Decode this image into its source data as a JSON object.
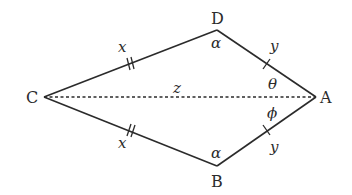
{
  "diagram": {
    "type": "kite-quadrilateral",
    "colors": {
      "stroke": "#2b2b2b",
      "background": "#ffffff"
    },
    "vertices": {
      "A": {
        "label": "A",
        "x": 316,
        "y": 97
      },
      "B": {
        "label": "B",
        "x": 217,
        "y": 166
      },
      "C": {
        "label": "C",
        "x": 44,
        "y": 97
      },
      "D": {
        "label": "D",
        "x": 217,
        "y": 30
      }
    },
    "sides": {
      "CD": {
        "label": "x",
        "tick": "double"
      },
      "CB": {
        "label": "x",
        "tick": "double"
      },
      "DA": {
        "label": "y",
        "tick": "single"
      },
      "BA": {
        "label": "y",
        "tick": "single"
      }
    },
    "diagonal": {
      "from": "C",
      "to": "A",
      "label": "z",
      "style": "dashed"
    },
    "angles": {
      "D": "α",
      "B": "α",
      "A_upper": "θ",
      "A_lower": "ϕ"
    }
  }
}
